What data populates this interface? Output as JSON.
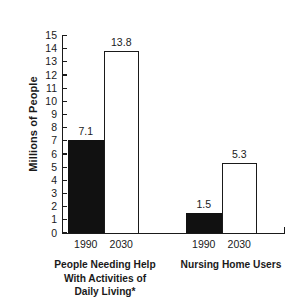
{
  "chart_data": {
    "type": "bar",
    "title": "",
    "xlabel": "",
    "ylabel": "Millions of People",
    "ylim": [
      0,
      15
    ],
    "ytick_values": [
      15,
      14,
      13,
      12,
      11,
      10,
      9,
      8,
      7,
      6,
      5,
      4,
      3,
      2,
      1,
      0
    ],
    "grid": false,
    "legend": null,
    "categories": [
      "1990",
      "2030",
      "1990",
      "2030"
    ],
    "groups": [
      {
        "caption": "People Needing Help With Activities of Daily Living*",
        "caption_lines": [
          "People Needing Help",
          "With Activities of",
          "Daily Living*"
        ],
        "bars": [
          {
            "category": "1990",
            "value": 7.1,
            "label": "7.1",
            "style": "filled"
          },
          {
            "category": "2030",
            "value": 13.8,
            "label": "13.8",
            "style": "hollow"
          }
        ]
      },
      {
        "caption": "Nursing Home Users",
        "caption_lines": [
          "Nursing Home Users"
        ],
        "bars": [
          {
            "category": "1990",
            "value": 1.5,
            "label": "1.5",
            "style": "filled"
          },
          {
            "category": "2030",
            "value": 5.3,
            "label": "5.3",
            "style": "hollow"
          }
        ]
      }
    ],
    "values": [
      7.1,
      13.8,
      1.5,
      5.3
    ],
    "colors": {
      "filled_bar": "#111111",
      "hollow_bar_outline": "#1a1a1a",
      "background": "#ffffff",
      "text": "#1a1a1a"
    }
  },
  "axis": {
    "y_title": "Millions of People",
    "ticks": [
      "15",
      "14",
      "13",
      "12",
      "11",
      "10",
      "9",
      "8",
      "7",
      "6",
      "5",
      "4",
      "3",
      "2",
      "1",
      "0"
    ]
  },
  "bars": {
    "b0": {
      "value_label": "7.1",
      "tick_label": "1990"
    },
    "b1": {
      "value_label": "13.8",
      "tick_label": "2030"
    },
    "b2": {
      "value_label": "1.5",
      "tick_label": "1990"
    },
    "b3": {
      "value_label": "5.3",
      "tick_label": "2030"
    }
  },
  "captions": {
    "left_line1": "People Needing Help",
    "left_line2": "With Activities of",
    "left_line3": "Daily Living*",
    "right_line1": "Nursing Home Users"
  }
}
